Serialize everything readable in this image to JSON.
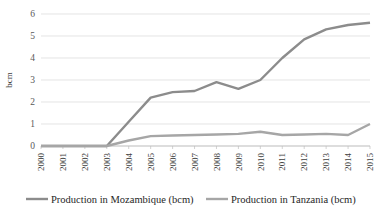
{
  "chart_data": {
    "type": "line",
    "title": "",
    "subtitle": "",
    "xlabel": "",
    "ylabel": "bcm",
    "x": [
      2000,
      2001,
      2002,
      2003,
      2004,
      2005,
      2006,
      2007,
      2008,
      2009,
      2010,
      2011,
      2012,
      2013,
      2014,
      2015
    ],
    "xtick_labels": [
      "2000",
      "2001",
      "2002",
      "2003",
      "2004",
      "2005",
      "2006",
      "2007",
      "2008",
      "2009",
      "2010",
      "2011",
      "2012",
      "2013",
      "2014",
      "2015"
    ],
    "ytick_labels": [
      "0",
      "1",
      "2",
      "3",
      "4",
      "5",
      "6"
    ],
    "yticks": [
      0,
      1,
      2,
      3,
      4,
      5,
      6
    ],
    "ylim": [
      0,
      6
    ],
    "xlim": [
      2000,
      2015
    ],
    "grid": "horizontal",
    "legend_position": "bottom",
    "series": [
      {
        "name": "Production in Mozambique (bcm)",
        "color": "#8c8c8c",
        "values": [
          0,
          0,
          0,
          0,
          1.1,
          2.2,
          2.45,
          2.5,
          2.9,
          2.6,
          3.0,
          4.0,
          4.85,
          5.3,
          5.5,
          5.6
        ]
      },
      {
        "name": "Production in Tanzania (bcm)",
        "color": "#a6a6a6",
        "values": [
          0,
          0,
          0,
          0,
          0.25,
          0.45,
          0.48,
          0.5,
          0.52,
          0.55,
          0.65,
          0.5,
          0.52,
          0.55,
          0.5,
          1.0
        ]
      }
    ]
  },
  "legend": {
    "items": [
      {
        "label": "Production in Mozambique (bcm)",
        "color": "#8c8c8c",
        "name": "legend-item-mozambique"
      },
      {
        "label": "Production in Tanzania (bcm)",
        "color": "#a6a6a6",
        "name": "legend-item-tanzania"
      }
    ]
  },
  "axes": {
    "y_axis_title": "bcm"
  },
  "colors": {
    "gridline": "#d9d9d9",
    "axis": "#bfbfbf",
    "tick_text": "#404040",
    "series_1": "#8c8c8c",
    "series_2": "#a6a6a6"
  }
}
